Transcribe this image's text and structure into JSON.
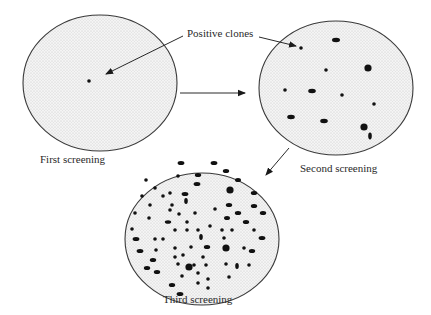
{
  "diagram": {
    "plates": [
      {
        "id": "first",
        "label": "First screening"
      },
      {
        "id": "second",
        "label": "Second screening"
      },
      {
        "id": "third",
        "label": "Third screening"
      }
    ],
    "annotation": "Positive clones",
    "colors": {
      "stroke": "#3a3a3a",
      "colony": "#111111",
      "plate_fill": "#f2f2f2",
      "stipple": "#c8c8c8"
    }
  }
}
